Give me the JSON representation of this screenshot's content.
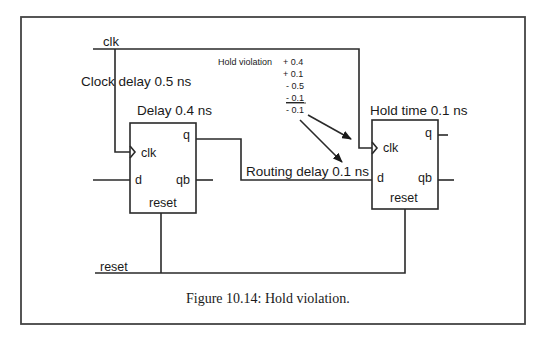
{
  "figure": {
    "caption": "Figure 10.14: Hold violation.",
    "colors": {
      "ink": "#2a2a2a",
      "frame": "#444444",
      "background": "#ffffff"
    }
  },
  "signals": {
    "clk": "clk",
    "reset": "reset"
  },
  "annotations": {
    "clock_delay": "Clock delay 0.5 ns",
    "ff1_delay": "Delay 0.4 ns",
    "routing_delay": "Routing delay 0.1 ns",
    "hold_time": "Hold time 0.1 ns"
  },
  "hold_calc": {
    "title": "Hold violation",
    "terms": [
      "+ 0.4",
      "+ 0.1",
      "- 0.5",
      "- 0.1"
    ],
    "result": "- 0.1"
  },
  "flipflops": [
    {
      "name": "ff1",
      "pins": {
        "clk": "clk",
        "d": "d",
        "q": "q",
        "qb": "qb",
        "reset": "reset"
      }
    },
    {
      "name": "ff2",
      "pins": {
        "clk": "clk",
        "d": "d",
        "q": "q",
        "qb": "qb",
        "reset": "reset"
      }
    }
  ]
}
